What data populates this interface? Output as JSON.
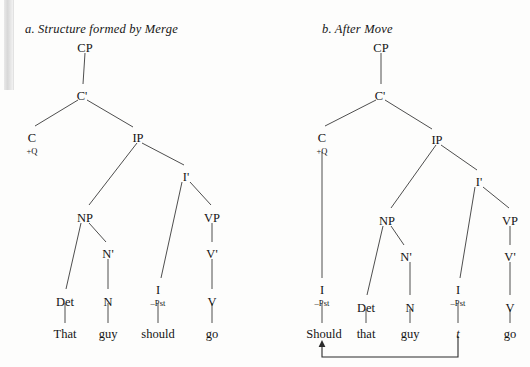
{
  "figure": {
    "type": "syntax-tree-pair",
    "background_color": "#fdfdfc",
    "line_color": "#3a3a3a"
  },
  "panel_a": {
    "caption": "a. Structure formed by Merge",
    "caption_x": 25,
    "caption_y": 22,
    "nodes": [
      {
        "id": "cp",
        "label": "CP",
        "x": 85,
        "y": 41
      },
      {
        "id": "cbar",
        "label": "C'",
        "x": 82,
        "y": 89
      },
      {
        "id": "c",
        "label": "C",
        "x": 32,
        "y": 131
      },
      {
        "id": "c_feat",
        "label": "+Q",
        "x": 32,
        "y": 143
      },
      {
        "id": "ip",
        "label": "IP",
        "x": 138,
        "y": 131
      },
      {
        "id": "ibar",
        "label": "I'",
        "x": 186,
        "y": 170
      },
      {
        "id": "np",
        "label": "NP",
        "x": 85,
        "y": 211
      },
      {
        "id": "nbar",
        "label": "N'",
        "x": 108,
        "y": 247
      },
      {
        "id": "vp",
        "label": "VP",
        "x": 212,
        "y": 211
      },
      {
        "id": "vbar",
        "label": "V'",
        "x": 212,
        "y": 247
      },
      {
        "id": "det",
        "label": "Det",
        "x": 65,
        "y": 295
      },
      {
        "id": "n",
        "label": "N",
        "x": 108,
        "y": 295
      },
      {
        "id": "i",
        "label": "I",
        "x": 158,
        "y": 283
      },
      {
        "id": "i_feat",
        "label": "–Pst",
        "x": 158,
        "y": 295
      },
      {
        "id": "v",
        "label": "V",
        "x": 212,
        "y": 295
      }
    ],
    "words": [
      {
        "id": "w_that",
        "label": "That",
        "x": 65,
        "y": 329
      },
      {
        "id": "w_guy",
        "label": "guy",
        "x": 108,
        "y": 329
      },
      {
        "id": "w_should",
        "label": "should",
        "x": 158,
        "y": 329
      },
      {
        "id": "w_go",
        "label": "go",
        "x": 212,
        "y": 329
      }
    ],
    "edges": [
      {
        "from": "CP",
        "to": "C'",
        "x1": 85,
        "y1": 53,
        "x2": 83,
        "y2": 84
      },
      {
        "from": "C'",
        "to": "C",
        "x1": 78,
        "y1": 100,
        "x2": 35,
        "y2": 126
      },
      {
        "from": "C'",
        "to": "IP",
        "x1": 87,
        "y1": 100,
        "x2": 133,
        "y2": 127
      },
      {
        "from": "IP",
        "to": "NP",
        "x1": 137,
        "y1": 143,
        "x2": 89,
        "y2": 205
      },
      {
        "from": "IP",
        "to": "I'",
        "x1": 142,
        "y1": 143,
        "x2": 184,
        "y2": 165
      },
      {
        "from": "I'",
        "to": "I",
        "x1": 182,
        "y1": 182,
        "x2": 161,
        "y2": 278
      },
      {
        "from": "I'",
        "to": "VP",
        "x1": 190,
        "y1": 182,
        "x2": 211,
        "y2": 205
      },
      {
        "from": "NP",
        "to": "Det",
        "x1": 81,
        "y1": 223,
        "x2": 66,
        "y2": 289
      },
      {
        "from": "NP",
        "to": "N'",
        "x1": 89,
        "y1": 223,
        "x2": 106,
        "y2": 242
      },
      {
        "from": "N'",
        "to": "N",
        "x1": 108,
        "y1": 259,
        "x2": 108,
        "y2": 289
      },
      {
        "from": "VP",
        "to": "V'",
        "x1": 212,
        "y1": 223,
        "x2": 212,
        "y2": 242
      },
      {
        "from": "V'",
        "to": "V",
        "x1": 212,
        "y1": 259,
        "x2": 212,
        "y2": 289
      },
      {
        "from": "Det",
        "to": "That",
        "x1": 65,
        "y1": 303,
        "x2": 65,
        "y2": 323
      },
      {
        "from": "N",
        "to": "guy",
        "x1": 108,
        "y1": 303,
        "x2": 108,
        "y2": 323
      },
      {
        "from": "I",
        "to": "should",
        "x1": 158,
        "y1": 303,
        "x2": 158,
        "y2": 323
      },
      {
        "from": "V",
        "to": "go",
        "x1": 212,
        "y1": 303,
        "x2": 212,
        "y2": 323
      }
    ]
  },
  "panel_b": {
    "caption": "b. After Move",
    "caption_x": 322,
    "caption_y": 22,
    "nodes": [
      {
        "id": "cp",
        "label": "CP",
        "x": 381,
        "y": 41
      },
      {
        "id": "cbar",
        "label": "C'",
        "x": 380,
        "y": 89
      },
      {
        "id": "c",
        "label": "C",
        "x": 322,
        "y": 131
      },
      {
        "id": "c_feat",
        "label": "+Q",
        "x": 322,
        "y": 143
      },
      {
        "id": "ip",
        "label": "IP",
        "x": 437,
        "y": 133
      },
      {
        "id": "ibar",
        "label": "I'",
        "x": 479,
        "y": 175
      },
      {
        "id": "np",
        "label": "NP",
        "x": 387,
        "y": 214
      },
      {
        "id": "nbar",
        "label": "N'",
        "x": 406,
        "y": 250
      },
      {
        "id": "vp",
        "label": "VP",
        "x": 510,
        "y": 214
      },
      {
        "id": "vbar",
        "label": "V'",
        "x": 510,
        "y": 250
      },
      {
        "id": "i_moved",
        "label": "I",
        "x": 322,
        "y": 283
      },
      {
        "id": "i_moved_feat",
        "label": "–Pst",
        "x": 322,
        "y": 295
      },
      {
        "id": "det",
        "label": "Det",
        "x": 366,
        "y": 301
      },
      {
        "id": "n",
        "label": "N",
        "x": 410,
        "y": 301
      },
      {
        "id": "i_trace",
        "label": "I",
        "x": 458,
        "y": 283
      },
      {
        "id": "i_trace_feat",
        "label": "–Pst",
        "x": 458,
        "y": 295
      },
      {
        "id": "v",
        "label": "V",
        "x": 510,
        "y": 301
      }
    ],
    "words": [
      {
        "id": "w_should",
        "label": "Should",
        "x": 324,
        "y": 329,
        "style": "normal"
      },
      {
        "id": "w_that",
        "label": "that",
        "x": 366,
        "y": 329,
        "style": "normal"
      },
      {
        "id": "w_guy",
        "label": "guy",
        "x": 410,
        "y": 329,
        "style": "normal"
      },
      {
        "id": "w_trace",
        "label": "t",
        "x": 458,
        "y": 329,
        "style": "italic"
      },
      {
        "id": "w_go",
        "label": "go",
        "x": 510,
        "y": 329,
        "style": "normal"
      }
    ],
    "edges": [
      {
        "from": "CP",
        "to": "C'",
        "x1": 381,
        "y1": 53,
        "x2": 381,
        "y2": 84
      },
      {
        "from": "C'",
        "to": "C",
        "x1": 376,
        "y1": 100,
        "x2": 325,
        "y2": 126
      },
      {
        "from": "C'",
        "to": "IP",
        "x1": 385,
        "y1": 100,
        "x2": 432,
        "y2": 129
      },
      {
        "from": "C",
        "to": "I",
        "x1": 322,
        "y1": 152,
        "x2": 322,
        "y2": 278
      },
      {
        "from": "IP",
        "to": "NP",
        "x1": 436,
        "y1": 145,
        "x2": 391,
        "y2": 208
      },
      {
        "from": "IP",
        "to": "I'",
        "x1": 441,
        "y1": 145,
        "x2": 477,
        "y2": 170
      },
      {
        "from": "I'",
        "to": "I_t",
        "x1": 475,
        "y1": 187,
        "x2": 460,
        "y2": 278
      },
      {
        "from": "I'",
        "to": "VP",
        "x1": 483,
        "y1": 187,
        "x2": 509,
        "y2": 208
      },
      {
        "from": "NP",
        "to": "Det",
        "x1": 383,
        "y1": 226,
        "x2": 367,
        "y2": 295
      },
      {
        "from": "NP",
        "to": "N'",
        "x1": 391,
        "y1": 226,
        "x2": 404,
        "y2": 245
      },
      {
        "from": "N'",
        "to": "N",
        "x1": 410,
        "y1": 262,
        "x2": 410,
        "y2": 295
      },
      {
        "from": "VP",
        "to": "V'",
        "x1": 510,
        "y1": 226,
        "x2": 510,
        "y2": 245
      },
      {
        "from": "V'",
        "to": "V",
        "x1": 510,
        "y1": 262,
        "x2": 510,
        "y2": 295
      },
      {
        "from": "I",
        "to": "Should",
        "x1": 322,
        "y1": 303,
        "x2": 322,
        "y2": 323
      },
      {
        "from": "Det",
        "to": "that",
        "x1": 366,
        "y1": 309,
        "x2": 366,
        "y2": 323
      },
      {
        "from": "N",
        "to": "guy",
        "x1": 410,
        "y1": 309,
        "x2": 410,
        "y2": 323
      },
      {
        "from": "I_t",
        "to": "t",
        "x1": 458,
        "y1": 303,
        "x2": 458,
        "y2": 323
      },
      {
        "from": "V",
        "to": "go",
        "x1": 510,
        "y1": 309,
        "x2": 510,
        "y2": 323
      }
    ],
    "movement_arrow": {
      "description": "movement arrow from trace t to fronted Should",
      "path": "M 458 336 L 458 357 L 322 357 L 322 345",
      "arrow_tip_x": 322,
      "arrow_tip_y": 341
    }
  }
}
